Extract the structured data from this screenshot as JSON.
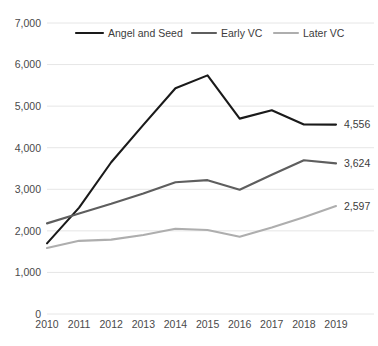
{
  "chart_data": {
    "type": "line",
    "title": "",
    "xlabel": "",
    "ylabel": "",
    "categories": [
      "2010",
      "2011",
      "2012",
      "2013",
      "2014",
      "2015",
      "2016",
      "2017",
      "2018",
      "2019"
    ],
    "ylim": [
      0,
      7000
    ],
    "yticks": [
      "0",
      "1,000",
      "2,000",
      "3,000",
      "4,000",
      "5,000",
      "6,000",
      "7,000"
    ],
    "ytick_values": [
      0,
      1000,
      2000,
      3000,
      4000,
      5000,
      6000,
      7000
    ],
    "grid": true,
    "legend_position": "top",
    "series": [
      {
        "name": "Angel and Seed",
        "color": "#1a1a1a",
        "values": [
          1700,
          2560,
          3650,
          4550,
          5430,
          5740,
          4700,
          4900,
          4560,
          4556
        ],
        "end_label": "4,556"
      },
      {
        "name": "Early VC",
        "color": "#5e5e5e",
        "values": [
          2180,
          2420,
          2650,
          2900,
          3170,
          3220,
          2990,
          3350,
          3700,
          3624
        ],
        "end_label": "3,624"
      },
      {
        "name": "Later VC",
        "color": "#aeaeae",
        "values": [
          1590,
          1760,
          1790,
          1900,
          2050,
          2020,
          1860,
          2080,
          2330,
          2597
        ],
        "end_label": "2,597"
      }
    ]
  }
}
